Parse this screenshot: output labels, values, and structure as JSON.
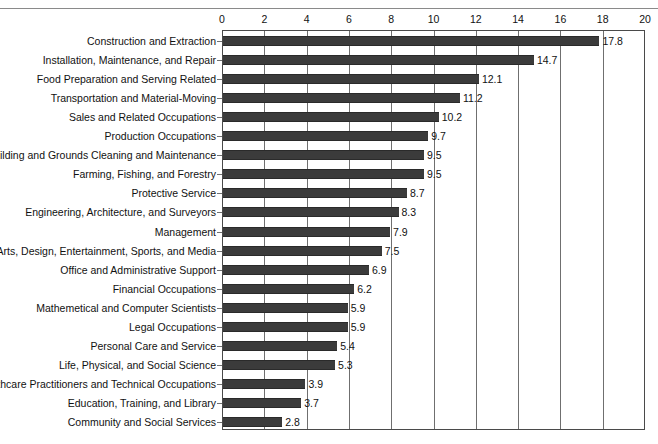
{
  "page": {
    "clipped_header_fragment": "                                                                  "
  },
  "chart_data": {
    "type": "bar",
    "orientation": "horizontal",
    "title": "",
    "subtitle": "",
    "xlabel": "",
    "ylabel": "",
    "xlim": [
      0,
      20
    ],
    "xtick_step": 2,
    "xticks": [
      "0",
      "2",
      "4",
      "6",
      "8",
      "10",
      "12",
      "14",
      "16",
      "18",
      "20"
    ],
    "grid": "vertical",
    "legend": "none",
    "bar_color": "#3b3b3b",
    "categories": [
      "Construction and Extraction",
      "Installation, Maintenance, and Repair",
      "Food Preparation and Serving Related",
      "Transportation and Material-Moving",
      "Sales and Related Occupations",
      "Production Occupations",
      "Building and Grounds Cleaning and Maintenance",
      "Farming, Fishing, and Forestry",
      "Protective Service",
      "Engineering, Architecture, and Surveyors",
      "Management",
      "Arts, Design, Entertainment, Sports, and Media",
      "Office and Administrative Support",
      "Financial Occupations",
      "Mathemetical and Computer Scientists",
      "Legal Occupations",
      "Personal Care and Service",
      "Life, Physical, and Social Science",
      "Healthcare Practitioners and Technical Occupations",
      "Education, Training, and Library",
      "Community and Social Services"
    ],
    "values": [
      17.8,
      14.7,
      12.1,
      11.2,
      10.2,
      9.7,
      9.5,
      9.5,
      8.7,
      8.3,
      7.9,
      7.5,
      6.9,
      6.2,
      5.9,
      5.9,
      5.4,
      5.3,
      3.9,
      3.7,
      2.8
    ],
    "value_labels": [
      "17.8",
      "14.7",
      "12.1",
      "11.2",
      "10.2",
      "9.7",
      "9.5",
      "9.5",
      "8.7",
      "8.3",
      "7.9",
      "7.5",
      "6.9",
      "6.2",
      "5.9",
      "5.9",
      "5.4",
      "5.3",
      "3.9",
      "3.7",
      "2.8"
    ]
  }
}
